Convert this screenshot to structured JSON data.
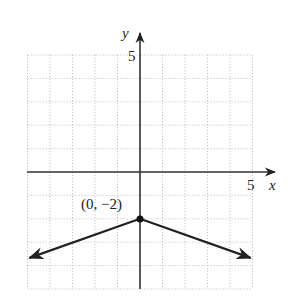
{
  "chart_data": {
    "type": "line",
    "title": "",
    "xlabel": "x",
    "ylabel": "y",
    "xlim": [
      -5,
      5
    ],
    "ylim": [
      -5,
      5
    ],
    "grid": true,
    "x_tick_label": "5",
    "y_tick_label": "5",
    "function": "y = -(1/3)|x| - 2",
    "series": [
      {
        "name": "absolute value graph",
        "x": [
          -5,
          0,
          5
        ],
        "y": [
          -3.67,
          -2,
          -3.67
        ],
        "arrows_at_ends": true
      }
    ],
    "annotations": [
      {
        "text": "(0, −2)",
        "x": 0,
        "y": -2,
        "marker": "filled-dot"
      }
    ]
  },
  "colors": {
    "axis": "#222222",
    "curve": "#222222",
    "grid": "#b8b8b8",
    "background": "#ffffff"
  }
}
